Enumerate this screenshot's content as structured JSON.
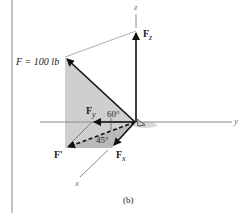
{
  "figure": {
    "caption": "(b)",
    "axes": {
      "x": "x",
      "y": "y",
      "z": "z"
    },
    "force": {
      "label": "F = 100 lb"
    },
    "components": {
      "Fz": {
        "base": "F",
        "sub": "z"
      },
      "Fy": {
        "base": "F",
        "sub": "y"
      },
      "Fx": {
        "base": "F",
        "sub": "x"
      },
      "Fprime": "F'"
    },
    "angles": {
      "vertical": "60°",
      "horizontal": "45°"
    },
    "colors": {
      "plane_shade": "#cfcfcf",
      "lower_shade": "#b9b9b9",
      "line": "#111111",
      "axis": "#8a8a8a"
    }
  }
}
